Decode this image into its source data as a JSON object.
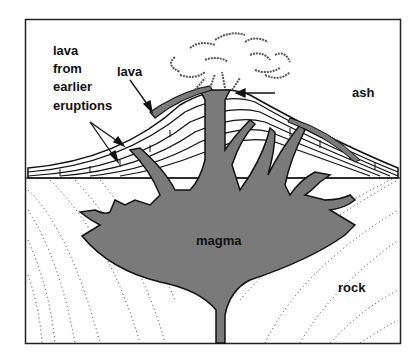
{
  "diagram": {
    "type": "volcano cross-section",
    "colors": {
      "magma": "#7a7a7a",
      "outline": "#111111",
      "background": "#ffffff"
    },
    "labels": {
      "lava_earlier_1": "lava",
      "lava_earlier_2": "from",
      "lava_earlier_3": "earlier",
      "lava_earlier_4": "eruptions",
      "lava": "lava",
      "ash": "ash",
      "magma": "magma",
      "rock": "rock"
    }
  }
}
